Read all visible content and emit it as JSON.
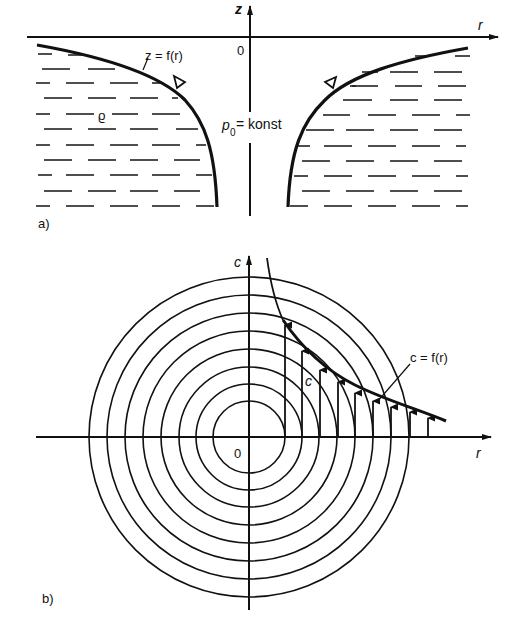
{
  "figure_a": {
    "label": "a)",
    "axis_z_label": "z",
    "axis_r_label": "r",
    "origin_label": "0",
    "surface_label": "z = f(r)",
    "density_label": "ϱ",
    "pressure_label_main": "p",
    "pressure_label_sub": "0",
    "pressure_label_rest": " = konst"
  },
  "figure_b": {
    "label": "b)",
    "axis_c_label": "c",
    "axis_r_label": "r",
    "origin_label": "0",
    "velocity_label": "c",
    "curve_label": "c = f(r)",
    "circle_count": 8
  },
  "colors": {
    "ink": "#111111",
    "background": "#ffffff"
  }
}
